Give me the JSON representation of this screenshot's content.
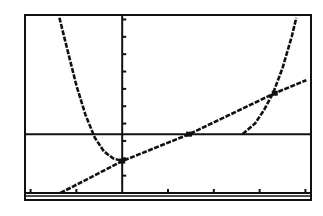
{
  "chart_data": {
    "type": "line",
    "title": "",
    "xlabel": "",
    "ylabel": "",
    "grid": false,
    "legend": "none",
    "xlim": [
      -2.1,
      4.1
    ],
    "ylim": [
      -0.4,
      10.2
    ],
    "x_tick_step": 1,
    "y_tick_step": 1,
    "axes": {
      "x_axis_y": 0,
      "y_axis_x": 0
    },
    "series": [
      {
        "name": "left curve",
        "x": [
          -1.37,
          -1.2,
          -1.0,
          -0.8,
          -0.6,
          -0.4,
          -0.2,
          0.0
        ],
        "y": [
          10.1,
          8.3,
          6.2,
          4.5,
          3.2,
          2.4,
          2.0,
          1.84
        ]
      },
      {
        "name": "right curve",
        "x": [
          2.63,
          2.9,
          3.1,
          3.3,
          3.5,
          3.7,
          3.8
        ],
        "y": [
          3.4,
          4.0,
          4.8,
          5.8,
          7.2,
          9.0,
          10.1
        ]
      },
      {
        "name": "line",
        "x": [
          -1.35,
          0.0,
          1.46,
          3.33,
          4.02
        ],
        "y": [
          0.0,
          1.84,
          3.39,
          5.75,
          6.5
        ]
      },
      {
        "name": "horizontal line",
        "x": [
          -2.1,
          4.1
        ],
        "y": [
          3.39,
          3.39
        ]
      }
    ],
    "intersections": [
      {
        "x": 0.0,
        "y": 1.84
      },
      {
        "x": 1.46,
        "y": 3.39
      },
      {
        "x": 3.33,
        "y": 5.75
      }
    ]
  },
  "screen": {
    "label": "graphing calculator screen"
  }
}
